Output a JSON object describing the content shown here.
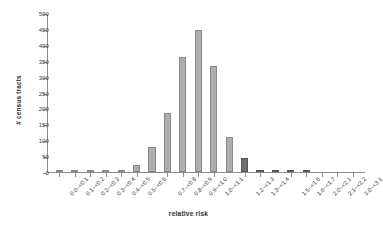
{
  "chart_data": {
    "type": "bar",
    "title": "",
    "xlabel": "relative risk",
    "ylabel": "# census tracts",
    "ylim": [
      0,
      500
    ],
    "ytick_labels": [
      "500",
      "450",
      "400",
      "350",
      "300",
      "250",
      "200",
      "150",
      "100",
      "50",
      "0"
    ],
    "ytick_values": [
      500,
      450,
      400,
      350,
      300,
      250,
      200,
      150,
      100,
      50,
      0
    ],
    "grid": false,
    "legend": null,
    "categories": [
      "0.0-<0.1",
      "0.1-<0.2",
      "0.2-<0.3",
      "0.3-<0.4",
      "0.4-<0.5",
      "0.5-<0.6",
      "0.7-<0.8",
      "0.8-<0.9",
      "0.9-<1.0",
      "1.0-<1.1",
      "1.2-<1.3",
      "1.3-<1.4",
      "1.5-<1.6",
      "1.6-<1.7",
      "2.0-<2.1",
      "2.1-<2.2",
      "3.0-<3.1"
    ],
    "bars": [
      {
        "label": "0.0-<0.1",
        "value": 7,
        "shade": "light"
      },
      {
        "label": "0.1-<0.2",
        "value": 1,
        "shade": "light"
      },
      {
        "label": "0.2-<0.3",
        "value": 1,
        "shade": "light"
      },
      {
        "label": "0.3-<0.4",
        "value": 1,
        "shade": "light"
      },
      {
        "label": "0.4-<0.5",
        "value": 3,
        "shade": "light"
      },
      {
        "label": "0.5-<0.6",
        "value": 21,
        "shade": "light"
      },
      {
        "label": "0.6-<0.7",
        "value": 80,
        "shade": "light"
      },
      {
        "label": "0.7-<0.8",
        "value": 187,
        "shade": "light"
      },
      {
        "label": "0.8-<0.9",
        "value": 365,
        "shade": "light"
      },
      {
        "label": "0.9-<1.0",
        "value": 448,
        "shade": "light"
      },
      {
        "label": "1.0-<1.1",
        "value": 337,
        "shade": "light"
      },
      {
        "label": "1.1-<1.2",
        "value": 110,
        "shade": "light"
      },
      {
        "label": "1.2-<1.3",
        "value": 45,
        "shade": "dark"
      },
      {
        "label": "1.3-<1.4",
        "value": 7,
        "shade": "dark"
      },
      {
        "label": "1.4-<1.5",
        "value": 5,
        "shade": "dark"
      },
      {
        "label": "1.5-<1.6",
        "value": 2,
        "shade": "dark"
      },
      {
        "label": "1.6-<1.7",
        "value": 1,
        "shade": "dark"
      },
      {
        "label": "2.0-<2.1",
        "value": 0,
        "shade": "dark"
      },
      {
        "label": "2.1-<2.2",
        "value": 0,
        "shade": "dark"
      },
      {
        "label": "3.0-<3.1",
        "value": 0,
        "shade": "dark"
      }
    ],
    "colors": {
      "bar_light": "#aeaeae",
      "bar_light_edge": "#8a8a8a",
      "bar_dark": "#6f6f6f",
      "bar_dark_edge": "#555555",
      "axis": "#8d8d8d",
      "text": "#3a3a3a",
      "background": "#ffffff"
    }
  }
}
